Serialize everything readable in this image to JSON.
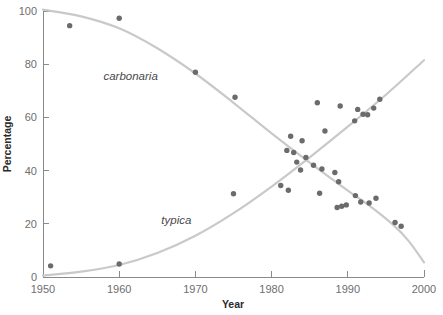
{
  "chart_data": {
    "type": "scatter",
    "title": "",
    "subtitle": "",
    "xlabel": "Year",
    "ylabel": "Percentage",
    "xlim": [
      1950,
      2000
    ],
    "ylim": [
      0,
      100
    ],
    "xticks": [
      1950,
      1960,
      1970,
      1980,
      1990,
      2000
    ],
    "yticks": [
      0,
      20,
      40,
      60,
      80,
      100
    ],
    "xticklabels": [
      "1950",
      "1960",
      "1970",
      "1980",
      "1990",
      "2000"
    ],
    "yticklabels": [
      "0",
      "20",
      "40",
      "60",
      "80",
      "100"
    ],
    "grid": false,
    "legend": "inline-annotations",
    "annotations": [
      {
        "text": "carbonaria",
        "x": 1961.5,
        "y": 74,
        "style": "italic"
      },
      {
        "text": "typica",
        "x": 1967.5,
        "y": 20,
        "style": "italic"
      }
    ],
    "colors": {
      "point": "#6b6b6b",
      "curve": "#c9c9c9",
      "axis": "#8a8a8a",
      "tick_label": "#6e6e6e",
      "axis_title": "#2b2b2b",
      "annotation": "#4a4a4a",
      "background": "#ffffff"
    },
    "series": [
      {
        "name": "carbonaria",
        "type": "scatter+fitted-curve",
        "marker": "filled-circle",
        "points": [
          {
            "x": 1953.5,
            "y": 94.5
          },
          {
            "x": 1960.0,
            "y": 97.3
          },
          {
            "x": 1970.0,
            "y": 77.0
          },
          {
            "x": 1975.2,
            "y": 67.6
          },
          {
            "x": 1982.0,
            "y": 47.6
          },
          {
            "x": 1982.9,
            "y": 46.8
          },
          {
            "x": 1983.3,
            "y": 43.2
          },
          {
            "x": 1984.5,
            "y": 44.9
          },
          {
            "x": 1983.8,
            "y": 40.2
          },
          {
            "x": 1985.5,
            "y": 42.0
          },
          {
            "x": 1986.6,
            "y": 40.6
          },
          {
            "x": 1986.3,
            "y": 31.5
          },
          {
            "x": 1988.3,
            "y": 39.3
          },
          {
            "x": 1988.8,
            "y": 35.8
          },
          {
            "x": 1988.6,
            "y": 26.1
          },
          {
            "x": 1989.2,
            "y": 26.6
          },
          {
            "x": 1989.8,
            "y": 27.1
          },
          {
            "x": 1991.0,
            "y": 30.6
          },
          {
            "x": 1991.7,
            "y": 28.2
          },
          {
            "x": 1992.8,
            "y": 27.8
          },
          {
            "x": 1993.7,
            "y": 29.6
          },
          {
            "x": 1996.2,
            "y": 20.5
          },
          {
            "x": 1997.0,
            "y": 19.1
          }
        ],
        "curve": [
          {
            "x": 1950.0,
            "y": 100.5
          },
          {
            "x": 1955.0,
            "y": 98.0
          },
          {
            "x": 1960.0,
            "y": 93.5
          },
          {
            "x": 1965.0,
            "y": 86.0
          },
          {
            "x": 1970.0,
            "y": 76.5
          },
          {
            "x": 1975.0,
            "y": 65.5
          },
          {
            "x": 1980.0,
            "y": 54.0
          },
          {
            "x": 1985.0,
            "y": 43.0
          },
          {
            "x": 1990.0,
            "y": 32.5
          },
          {
            "x": 1993.0,
            "y": 26.5
          },
          {
            "x": 1996.0,
            "y": 19.5
          },
          {
            "x": 1998.0,
            "y": 13.5
          },
          {
            "x": 2000.0,
            "y": 5.5
          }
        ]
      },
      {
        "name": "typica",
        "type": "scatter+fitted-curve",
        "marker": "filled-circle",
        "points": [
          {
            "x": 1951.0,
            "y": 4.2
          },
          {
            "x": 1960.0,
            "y": 4.9
          },
          {
            "x": 1975.0,
            "y": 31.3
          },
          {
            "x": 1981.2,
            "y": 34.4
          },
          {
            "x": 1982.2,
            "y": 32.6
          },
          {
            "x": 1982.5,
            "y": 52.9
          },
          {
            "x": 1984.0,
            "y": 51.2
          },
          {
            "x": 1986.0,
            "y": 65.5
          },
          {
            "x": 1987.0,
            "y": 54.9
          },
          {
            "x": 1989.0,
            "y": 64.3
          },
          {
            "x": 1990.9,
            "y": 58.7
          },
          {
            "x": 1991.3,
            "y": 63.0
          },
          {
            "x": 1992.0,
            "y": 61.2
          },
          {
            "x": 1992.6,
            "y": 61.0
          },
          {
            "x": 1993.4,
            "y": 63.5
          },
          {
            "x": 1994.2,
            "y": 66.8
          }
        ],
        "curve": [
          {
            "x": 1950.0,
            "y": 0.5
          },
          {
            "x": 1955.0,
            "y": 2.0
          },
          {
            "x": 1960.0,
            "y": 4.5
          },
          {
            "x": 1965.0,
            "y": 9.0
          },
          {
            "x": 1970.0,
            "y": 15.5
          },
          {
            "x": 1975.0,
            "y": 24.0
          },
          {
            "x": 1980.0,
            "y": 34.0
          },
          {
            "x": 1985.0,
            "y": 45.0
          },
          {
            "x": 1990.0,
            "y": 56.5
          },
          {
            "x": 1995.0,
            "y": 68.5
          },
          {
            "x": 2000.0,
            "y": 81.5
          }
        ]
      }
    ]
  }
}
